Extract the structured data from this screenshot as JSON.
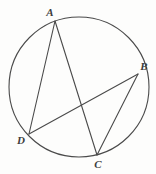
{
  "figure": {
    "background_color": "#fdfdfc",
    "stroke_color": "#4a4a4a",
    "label_color": "#3d3d3d",
    "circle": {
      "name": "circumscribed-circle",
      "cx": 79,
      "cy": 87,
      "r": 70,
      "stroke_width": 1.1
    },
    "points": [
      {
        "id": "A",
        "label": "A",
        "x": 55,
        "y": 21,
        "label_x": 50,
        "label_y": 16
      },
      {
        "id": "B",
        "label": "B",
        "x": 138,
        "y": 74,
        "label_x": 144,
        "label_y": 70
      },
      {
        "id": "C",
        "label": "C",
        "x": 97,
        "y": 155,
        "label_x": 98,
        "label_y": 168
      },
      {
        "id": "D",
        "label": "D",
        "x": 29,
        "y": 134,
        "label_x": 21,
        "label_y": 144
      }
    ],
    "chords": [
      {
        "id": "AD",
        "from": "A",
        "to": "D",
        "x1": 55,
        "y1": 21,
        "x2": 29,
        "y2": 134
      },
      {
        "id": "AC",
        "from": "A",
        "to": "C",
        "x1": 55,
        "y1": 21,
        "x2": 97,
        "y2": 155
      },
      {
        "id": "DB",
        "from": "D",
        "to": "B",
        "x1": 29,
        "y1": 134,
        "x2": 138,
        "y2": 74
      },
      {
        "id": "BC",
        "from": "B",
        "to": "C",
        "x1": 138,
        "y1": 74,
        "x2": 97,
        "y2": 155
      }
    ],
    "intersection": {
      "id": "AC-DB",
      "x": 80,
      "y": 105
    }
  }
}
